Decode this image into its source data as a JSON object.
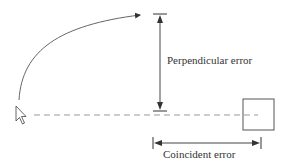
{
  "diagram": {
    "labels": {
      "perpendicular": "Perpendicular error",
      "coincident": "Coincident error"
    },
    "icons": {
      "cursor": "mouse-pointer-icon",
      "target": "target-square"
    },
    "colors": {
      "stroke": "#555555",
      "dashed": "#999999",
      "text": "#333333"
    }
  }
}
